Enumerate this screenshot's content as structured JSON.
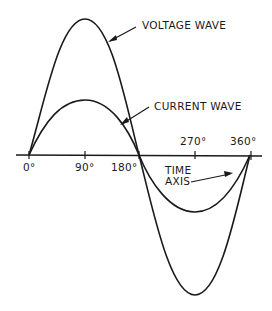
{
  "diagram": {
    "title": "",
    "labels": {
      "voltage_wave": "VOLTAGE WAVE",
      "current_wave": "CURRENT WAVE",
      "time_axis_line1": "TIME",
      "time_axis_line2": "AXIS"
    },
    "ticks": [
      {
        "label": "0°",
        "deg": 0
      },
      {
        "label": "90°",
        "deg": 90
      },
      {
        "label": "180°",
        "deg": 180
      },
      {
        "label": "270°",
        "deg": 270
      },
      {
        "label": "360°",
        "deg": 360
      }
    ],
    "waves": [
      {
        "name": "Voltage wave",
        "amplitude_relative": 1.0,
        "phase_deg": 0
      },
      {
        "name": "Current wave",
        "amplitude_relative": 0.4,
        "phase_deg": 0
      }
    ],
    "colors": {
      "line": "#1a1a1a",
      "background": "#ffffff"
    }
  }
}
